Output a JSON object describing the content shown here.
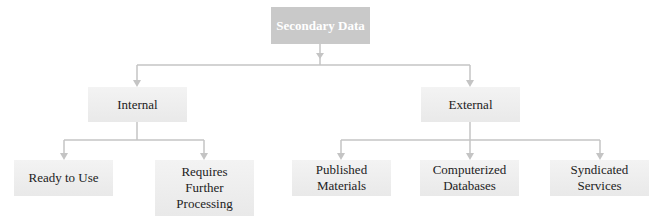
{
  "diagram": {
    "type": "hierarchy",
    "root": {
      "label": "Secondary Data",
      "fill": "#c9c9c9",
      "text_color": "#ffffff"
    },
    "level1": [
      {
        "label": "Internal"
      },
      {
        "label": "External"
      }
    ],
    "internal_children": [
      {
        "label": "Ready to Use"
      },
      {
        "label": "Requires Further Processing"
      }
    ],
    "external_children": [
      {
        "label": "Published Materials"
      },
      {
        "label": "Computerized Databases"
      },
      {
        "label": "Syndicated Services"
      }
    ],
    "colors": {
      "box_fill": "#eeeeee",
      "connector": "#c4c4c4",
      "text": "#222222"
    }
  }
}
